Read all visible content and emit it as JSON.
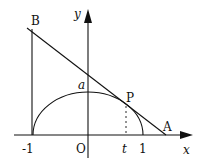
{
  "diagram": {
    "type": "coordinate-geometry",
    "axes": {
      "x_label": "x",
      "y_label": "y",
      "origin_label": "O"
    },
    "ticks": {
      "neg_one": "-1",
      "one": "1",
      "t": "t"
    },
    "points": {
      "B": "B",
      "P": "P",
      "A": "A",
      "a": "a"
    },
    "curve": "semi-ellipse x^2 + y^2/a^2 = 1, y >= 0",
    "tangent_line": "tangent at P(t, y_t) intersecting x-axis at A and line x = -1 at B"
  }
}
